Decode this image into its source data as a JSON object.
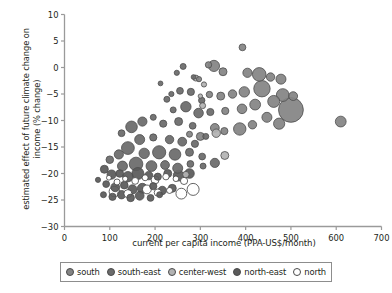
{
  "chart_data": {
    "type": "scatter",
    "title": "",
    "xlabel": "current per capita income (PPA-US$/month)",
    "ylabel": "estimated effect of future climate change on income (% change)",
    "xlim": [
      0,
      700
    ],
    "ylim": [
      -30,
      10
    ],
    "xticks": [
      0,
      100,
      200,
      300,
      400,
      500,
      600,
      700
    ],
    "yticks": [
      10,
      5,
      0,
      -5,
      -10,
      -15,
      -20,
      -25,
      -30
    ],
    "grid": false,
    "legend_position": "bottom",
    "size_encodes": "population",
    "series": [
      {
        "name": "south",
        "color": "#848484",
        "points": []
      },
      {
        "name": "south-east",
        "color": "#6b6b6b",
        "points": []
      },
      {
        "name": "center-west",
        "color": "#b3b3b3",
        "points": []
      },
      {
        "name": "north-east",
        "color": "#5a5a5a",
        "points": []
      },
      {
        "name": "north",
        "color": "#ffffff",
        "points": []
      }
    ],
    "points": [
      {
        "g": 1,
        "x": 393,
        "y": 3.8,
        "r": 3.4
      },
      {
        "g": 1,
        "x": 318,
        "y": 0.5,
        "r": 3.2
      },
      {
        "g": 1,
        "x": 330,
        "y": 0.3,
        "r": 5.6
      },
      {
        "g": 1,
        "x": 350,
        "y": -0.8,
        "r": 4.0
      },
      {
        "g": 1,
        "x": 297,
        "y": -2.2,
        "r": 2.6
      },
      {
        "g": 1,
        "x": 404,
        "y": -1.0,
        "r": 4.6
      },
      {
        "g": 1,
        "x": 430,
        "y": -1.3,
        "r": 6.8
      },
      {
        "g": 1,
        "x": 455,
        "y": -1.8,
        "r": 4.2
      },
      {
        "g": 1,
        "x": 478,
        "y": -2.2,
        "r": 5.0
      },
      {
        "g": 1,
        "x": 436,
        "y": -4.0,
        "r": 8.2
      },
      {
        "g": 1,
        "x": 397,
        "y": -4.6,
        "r": 5.2
      },
      {
        "g": 1,
        "x": 371,
        "y": -5.0,
        "r": 4.2
      },
      {
        "g": 1,
        "x": 345,
        "y": -5.4,
        "r": 4.0
      },
      {
        "g": 1,
        "x": 320,
        "y": -5.1,
        "r": 3.2
      },
      {
        "g": 1,
        "x": 482,
        "y": -5.2,
        "r": 6.4
      },
      {
        "g": 1,
        "x": 505,
        "y": -5.4,
        "r": 4.4
      },
      {
        "g": 1,
        "x": 462,
        "y": -6.4,
        "r": 6.0
      },
      {
        "g": 1,
        "x": 421,
        "y": -7.0,
        "r": 5.4
      },
      {
        "g": 1,
        "x": 392,
        "y": -7.8,
        "r": 4.8
      },
      {
        "g": 1,
        "x": 355,
        "y": -8.2,
        "r": 3.6
      },
      {
        "g": 1,
        "x": 500,
        "y": -8.0,
        "r": 12.4
      },
      {
        "g": 1,
        "x": 447,
        "y": -9.4,
        "r": 5.0
      },
      {
        "g": 1,
        "x": 474,
        "y": -10.6,
        "r": 5.6
      },
      {
        "g": 1,
        "x": 415,
        "y": -10.8,
        "r": 4.2
      },
      {
        "g": 1,
        "x": 387,
        "y": -11.6,
        "r": 6.2
      },
      {
        "g": 1,
        "x": 353,
        "y": -12.0,
        "r": 3.6
      },
      {
        "g": 1,
        "x": 332,
        "y": -11.4,
        "r": 4.4
      },
      {
        "g": 1,
        "x": 610,
        "y": -10.2,
        "r": 5.4
      },
      {
        "g": 1,
        "x": 300,
        "y": -13.0,
        "r": 4.0
      },
      {
        "g": 1,
        "x": 276,
        "y": -12.6,
        "r": 3.0
      },
      {
        "g": 2,
        "x": 262,
        "y": 0.2,
        "r": 3.0
      },
      {
        "g": 2,
        "x": 248,
        "y": -1.0,
        "r": 2.6
      },
      {
        "g": 2,
        "x": 285,
        "y": -1.8,
        "r": 2.4
      },
      {
        "g": 2,
        "x": 255,
        "y": -4.4,
        "r": 3.4
      },
      {
        "g": 2,
        "x": 236,
        "y": -5.0,
        "r": 2.6
      },
      {
        "g": 2,
        "x": 279,
        "y": -4.6,
        "r": 3.6
      },
      {
        "g": 2,
        "x": 303,
        "y": -6.2,
        "r": 3.2
      },
      {
        "g": 2,
        "x": 268,
        "y": -7.4,
        "r": 5.2
      },
      {
        "g": 2,
        "x": 240,
        "y": -8.0,
        "r": 3.0
      },
      {
        "g": 2,
        "x": 296,
        "y": -8.6,
        "r": 4.8
      },
      {
        "g": 2,
        "x": 322,
        "y": -8.4,
        "r": 3.6
      },
      {
        "g": 2,
        "x": 212,
        "y": -3.0,
        "r": 2.4
      },
      {
        "g": 2,
        "x": 226,
        "y": -6.0,
        "r": 3.0
      },
      {
        "g": 2,
        "x": 252,
        "y": -10.2,
        "r": 4.0
      },
      {
        "g": 2,
        "x": 283,
        "y": -11.0,
        "r": 3.4
      },
      {
        "g": 2,
        "x": 218,
        "y": -10.6,
        "r": 3.6
      },
      {
        "g": 2,
        "x": 196,
        "y": -9.4,
        "r": 3.0
      },
      {
        "g": 2,
        "x": 172,
        "y": -10.2,
        "r": 4.6
      },
      {
        "g": 2,
        "x": 148,
        "y": -11.2,
        "r": 5.8
      },
      {
        "g": 2,
        "x": 126,
        "y": -12.4,
        "r": 3.4
      },
      {
        "g": 2,
        "x": 166,
        "y": -13.6,
        "r": 5.0
      },
      {
        "g": 2,
        "x": 196,
        "y": -13.2,
        "r": 3.6
      },
      {
        "g": 2,
        "x": 232,
        "y": -13.6,
        "r": 4.2
      },
      {
        "g": 2,
        "x": 260,
        "y": -14.0,
        "r": 4.4
      },
      {
        "g": 2,
        "x": 288,
        "y": -14.4,
        "r": 3.6
      },
      {
        "g": 2,
        "x": 312,
        "y": -13.0,
        "r": 3.0
      },
      {
        "g": 2,
        "x": 140,
        "y": -15.2,
        "r": 6.4
      },
      {
        "g": 2,
        "x": 176,
        "y": -16.2,
        "r": 5.2
      },
      {
        "g": 2,
        "x": 209,
        "y": -16.0,
        "r": 6.6
      },
      {
        "g": 2,
        "x": 244,
        "y": -16.4,
        "r": 5.8
      },
      {
        "g": 2,
        "x": 276,
        "y": -16.0,
        "r": 4.0
      },
      {
        "g": 2,
        "x": 304,
        "y": -16.8,
        "r": 3.4
      },
      {
        "g": 2,
        "x": 120,
        "y": -16.4,
        "r": 4.6
      },
      {
        "g": 2,
        "x": 100,
        "y": -17.4,
        "r": 3.8
      },
      {
        "g": 2,
        "x": 128,
        "y": -18.6,
        "r": 5.0
      },
      {
        "g": 2,
        "x": 158,
        "y": -18.2,
        "r": 6.8
      },
      {
        "g": 2,
        "x": 192,
        "y": -18.6,
        "r": 5.4
      },
      {
        "g": 2,
        "x": 222,
        "y": -18.4,
        "r": 4.4
      },
      {
        "g": 2,
        "x": 250,
        "y": -19.0,
        "r": 5.0
      },
      {
        "g": 2,
        "x": 278,
        "y": -18.2,
        "r": 3.4
      },
      {
        "g": 2,
        "x": 306,
        "y": -18.6,
        "r": 3.0
      },
      {
        "g": 2,
        "x": 332,
        "y": -18.0,
        "r": 4.6
      },
      {
        "g": 3,
        "x": 290,
        "y": -2.0,
        "r": 3.0
      },
      {
        "g": 3,
        "x": 308,
        "y": -3.2,
        "r": 2.6
      },
      {
        "g": 3,
        "x": 300,
        "y": -5.4,
        "r": 2.2
      },
      {
        "g": 3,
        "x": 305,
        "y": -7.2,
        "r": 3.0
      },
      {
        "g": 3,
        "x": 335,
        "y": -12.4,
        "r": 4.2
      },
      {
        "g": 3,
        "x": 354,
        "y": -16.6,
        "r": 4.0
      },
      {
        "g": 3,
        "x": 268,
        "y": -20.2,
        "r": 3.2
      },
      {
        "g": 4,
        "x": 88,
        "y": -19.2,
        "r": 4.0
      },
      {
        "g": 4,
        "x": 104,
        "y": -20.2,
        "r": 4.6
      },
      {
        "g": 4,
        "x": 122,
        "y": -20.0,
        "r": 3.8
      },
      {
        "g": 4,
        "x": 140,
        "y": -20.6,
        "r": 5.2
      },
      {
        "g": 4,
        "x": 162,
        "y": -20.0,
        "r": 6.0
      },
      {
        "g": 4,
        "x": 186,
        "y": -20.4,
        "r": 4.2
      },
      {
        "g": 4,
        "x": 206,
        "y": -20.6,
        "r": 3.6
      },
      {
        "g": 4,
        "x": 228,
        "y": -20.0,
        "r": 4.0
      },
      {
        "g": 4,
        "x": 252,
        "y": -20.4,
        "r": 5.4
      },
      {
        "g": 4,
        "x": 276,
        "y": -20.0,
        "r": 4.8
      },
      {
        "g": 4,
        "x": 74,
        "y": -21.2,
        "r": 2.6
      },
      {
        "g": 4,
        "x": 92,
        "y": -22.0,
        "r": 3.4
      },
      {
        "g": 4,
        "x": 112,
        "y": -22.6,
        "r": 4.4
      },
      {
        "g": 4,
        "x": 132,
        "y": -22.2,
        "r": 3.8
      },
      {
        "g": 4,
        "x": 150,
        "y": -23.0,
        "r": 4.6
      },
      {
        "g": 4,
        "x": 172,
        "y": -22.8,
        "r": 5.0
      },
      {
        "g": 4,
        "x": 196,
        "y": -22.4,
        "r": 3.6
      },
      {
        "g": 4,
        "x": 216,
        "y": -23.2,
        "r": 4.2
      },
      {
        "g": 4,
        "x": 238,
        "y": -22.8,
        "r": 4.0
      },
      {
        "g": 4,
        "x": 86,
        "y": -24.0,
        "r": 3.0
      },
      {
        "g": 4,
        "x": 106,
        "y": -24.4,
        "r": 3.6
      },
      {
        "g": 4,
        "x": 126,
        "y": -24.0,
        "r": 4.2
      },
      {
        "g": 4,
        "x": 146,
        "y": -24.6,
        "r": 3.8
      },
      {
        "g": 4,
        "x": 166,
        "y": -24.2,
        "r": 4.4
      },
      {
        "g": 4,
        "x": 190,
        "y": -24.6,
        "r": 3.4
      },
      {
        "g": 4,
        "x": 210,
        "y": -24.0,
        "r": 3.0
      },
      {
        "g": 5,
        "x": 98,
        "y": -20.8,
        "r": 2.4
      },
      {
        "g": 5,
        "x": 116,
        "y": -21.6,
        "r": 3.0
      },
      {
        "g": 5,
        "x": 134,
        "y": -21.0,
        "r": 2.6
      },
      {
        "g": 5,
        "x": 156,
        "y": -21.4,
        "r": 3.4
      },
      {
        "g": 5,
        "x": 178,
        "y": -20.8,
        "r": 3.0
      },
      {
        "g": 5,
        "x": 200,
        "y": -21.2,
        "r": 4.0
      },
      {
        "g": 5,
        "x": 224,
        "y": -20.6,
        "r": 3.2
      },
      {
        "g": 5,
        "x": 246,
        "y": -21.0,
        "r": 2.8
      },
      {
        "g": 5,
        "x": 110,
        "y": -23.4,
        "r": 5.2
      },
      {
        "g": 5,
        "x": 140,
        "y": -23.8,
        "r": 4.0
      },
      {
        "g": 5,
        "x": 182,
        "y": -23.0,
        "r": 4.4
      },
      {
        "g": 5,
        "x": 206,
        "y": -23.6,
        "r": 3.6
      },
      {
        "g": 5,
        "x": 232,
        "y": -23.2,
        "r": 3.0
      },
      {
        "g": 5,
        "x": 258,
        "y": -23.8,
        "r": 5.4
      },
      {
        "g": 5,
        "x": 284,
        "y": -23.0,
        "r": 6.0
      },
      {
        "g": 5,
        "x": 264,
        "y": -21.4,
        "r": 3.6
      }
    ]
  },
  "legend": {
    "items": [
      {
        "label": "south",
        "color": "#848484"
      },
      {
        "label": "south-east",
        "color": "#6b6b6b"
      },
      {
        "label": "center-west",
        "color": "#b3b3b3"
      },
      {
        "label": "north-east",
        "color": "#5a5a5a"
      },
      {
        "label": "north",
        "color": "#ffffff"
      }
    ]
  },
  "axes": {
    "x_title": "current per capita income (PPA-US$/month)",
    "y_title": "estimated effect of future climate change on income (% change)"
  }
}
